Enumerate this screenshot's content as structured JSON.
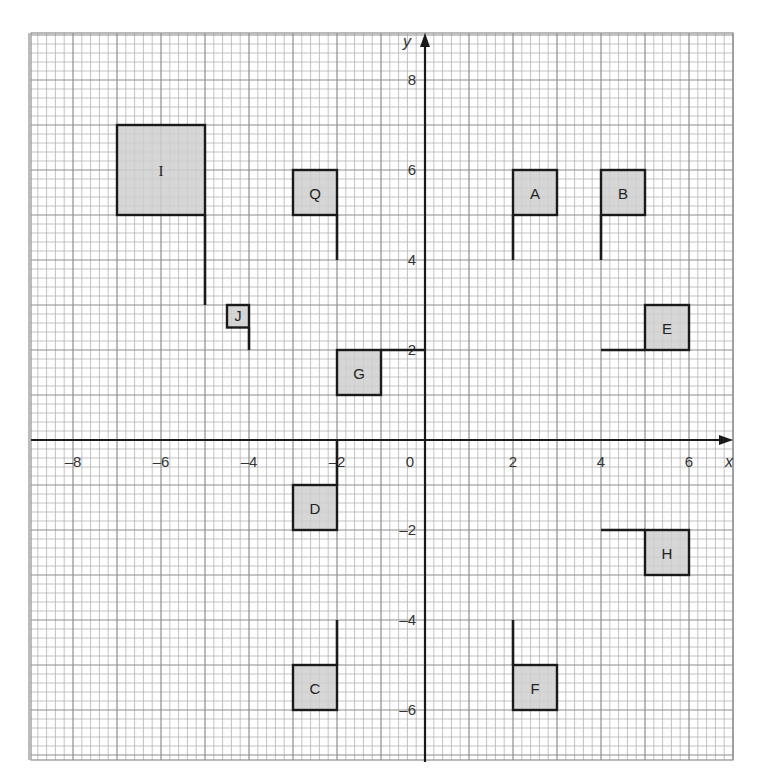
{
  "diagram": {
    "title": "",
    "axes": {
      "x_label": "x",
      "y_label": "y",
      "x_range": [
        -9,
        7
      ],
      "y_range": [
        -7.1,
        9.05
      ],
      "x_ticks": [
        {
          "value": -8,
          "label": "–8"
        },
        {
          "value": -6,
          "label": "–6"
        },
        {
          "value": -4,
          "label": "–4"
        },
        {
          "value": -2,
          "label": "–2"
        },
        {
          "value": 0,
          "label": "0"
        },
        {
          "value": 2,
          "label": "2"
        },
        {
          "value": 4,
          "label": "4"
        },
        {
          "value": 6,
          "label": "6"
        }
      ],
      "y_ticks": [
        {
          "value": 8,
          "label": "8"
        },
        {
          "value": 6,
          "label": "6"
        },
        {
          "value": 4,
          "label": "4"
        },
        {
          "value": 2,
          "label": "2"
        },
        {
          "value": -2,
          "label": "–2"
        },
        {
          "value": -4,
          "label": "–4"
        },
        {
          "value": -6,
          "label": "–6"
        }
      ],
      "minor_per_unit": 5
    },
    "colors": {
      "grid_minor": "#b4b4b4",
      "grid_major": "#8e8e8e",
      "axis": "#1a1a1a",
      "flag_fill": "#cfcfcf",
      "flag_stroke": "#1a1a1a"
    },
    "flags": [
      {
        "label": "A",
        "square": [
          2,
          5,
          3,
          6
        ],
        "pole": [
          2,
          5,
          2,
          4
        ]
      },
      {
        "label": "B",
        "square": [
          4,
          5,
          5,
          6
        ],
        "pole": [
          4,
          5,
          4,
          4
        ]
      },
      {
        "label": "C",
        "square": [
          -3,
          -6,
          -2,
          -5
        ],
        "pole": [
          -2,
          -5,
          -2,
          -4
        ]
      },
      {
        "label": "D",
        "square": [
          -3,
          -2,
          -2,
          -1
        ],
        "pole": [
          -2,
          -1,
          -2,
          0
        ]
      },
      {
        "label": "E",
        "square": [
          5,
          2,
          6,
          3
        ],
        "pole": [
          5,
          2,
          4,
          2
        ]
      },
      {
        "label": "F",
        "square": [
          2,
          -6,
          3,
          -5
        ],
        "pole": [
          2,
          -5,
          2,
          -4
        ]
      },
      {
        "label": "G",
        "square": [
          -2,
          1,
          -1,
          2
        ],
        "pole": [
          -1,
          2,
          0,
          2
        ]
      },
      {
        "label": "H",
        "square": [
          5,
          -3,
          6,
          -2
        ],
        "pole": [
          5,
          -2,
          4,
          -2
        ]
      },
      {
        "label": "I",
        "square": [
          -7,
          5,
          -5,
          7
        ],
        "pole": [
          -5,
          5,
          -5,
          3
        ]
      },
      {
        "label": "J",
        "square": [
          -4.5,
          2.5,
          -4,
          3
        ],
        "pole": [
          -4,
          2.5,
          -4,
          2
        ]
      },
      {
        "label": "Q",
        "square": [
          -3,
          5,
          -2,
          6
        ],
        "pole": [
          -2,
          5,
          -2,
          4
        ]
      }
    ]
  }
}
